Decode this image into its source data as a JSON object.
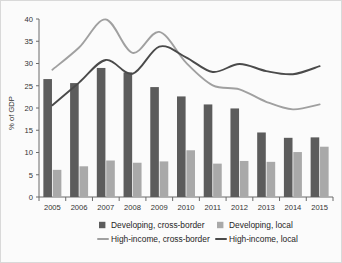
{
  "chart_data": {
    "type": "bar",
    "title": "",
    "xlabel": "",
    "ylabel": "% of GDP",
    "ylim": [
      0,
      40
    ],
    "yticks": [
      0,
      5,
      10,
      15,
      20,
      25,
      30,
      35,
      40
    ],
    "grid": false,
    "legend_position": "bottom",
    "categories": [
      "2005",
      "2006",
      "2007",
      "2008",
      "2009",
      "2010",
      "2011",
      "2012",
      "2013",
      "2014",
      "2015"
    ],
    "series": [
      {
        "name": "Developing, cross-border",
        "kind": "bar",
        "color": "#5c5c5c",
        "values": [
          26.5,
          25.6,
          29.0,
          28.0,
          24.7,
          22.6,
          20.8,
          19.9,
          14.5,
          13.3,
          13.4
        ]
      },
      {
        "name": "Developing, local",
        "kind": "bar",
        "color": "#a9a9a9",
        "values": [
          6.1,
          6.9,
          8.2,
          7.7,
          8.0,
          10.5,
          7.5,
          8.1,
          7.9,
          10.1,
          11.3
        ]
      },
      {
        "name": "High-income, cross-border",
        "kind": "line",
        "color": "#a0a0a0",
        "values": [
          28.6,
          33.6,
          39.9,
          32.4,
          37.1,
          30.2,
          25.1,
          24.2,
          21.4,
          19.7,
          20.8
        ]
      },
      {
        "name": "High-income, local",
        "kind": "line",
        "color": "#4a4a4a",
        "values": [
          20.6,
          25.7,
          30.8,
          27.7,
          33.8,
          31.4,
          28.1,
          29.9,
          28.3,
          27.6,
          29.4
        ]
      }
    ]
  },
  "legend": {
    "items": [
      {
        "label": "Developing, cross-border",
        "marker": "square",
        "color": "#5c5c5c"
      },
      {
        "label": "Developing, local",
        "marker": "square",
        "color": "#a9a9a9"
      },
      {
        "label": "High-income, cross-border",
        "marker": "line",
        "color": "#a0a0a0"
      },
      {
        "label": "High-income, local",
        "marker": "line",
        "color": "#4a4a4a"
      }
    ]
  }
}
